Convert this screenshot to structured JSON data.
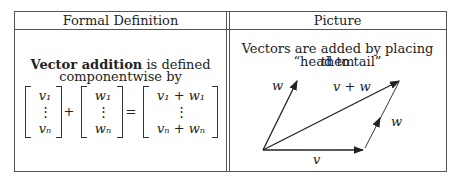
{
  "table": {
    "headers": [
      "Formal Definition",
      "Picture"
    ],
    "formal": {
      "bold": "Vector addition",
      "rest_line1": " is defined",
      "line2": "componentwise by",
      "matrix_a": [
        "v₁",
        "⋮",
        "vₙ"
      ],
      "plus": "+",
      "matrix_b": [
        "w₁",
        "⋮",
        "wₙ"
      ],
      "equals": "=",
      "matrix_c": [
        "v₁ + w₁",
        "⋮",
        "vₙ + wₙ"
      ]
    },
    "picture": {
      "line1": "Vectors are added by placing them",
      "line2": "“head to tail”",
      "labels": {
        "w_left": "w",
        "v_plus_w": "v + w",
        "w_right": "w",
        "v": "v"
      }
    }
  }
}
